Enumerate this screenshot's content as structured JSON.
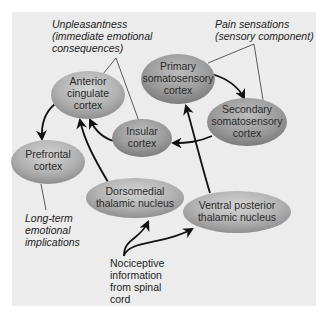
{
  "diagram": {
    "colors": {
      "background": "#ececec",
      "node_fill_light": "#c9c9c9",
      "node_fill_dark": "#8f8f8f",
      "arrow": "#111111",
      "leader_line": "#333333"
    },
    "nodes": {
      "anterior_cingulate": {
        "lines": [
          "Anterior",
          "cingulate",
          "cortex"
        ]
      },
      "primary_somatosensory": {
        "lines": [
          "Primary",
          "somatosensory",
          "cortex"
        ]
      },
      "secondary_somatosensory": {
        "lines": [
          "Secondary",
          "somatosensory",
          "cortex"
        ]
      },
      "insular": {
        "lines": [
          "Insular",
          "cortex"
        ]
      },
      "prefrontal": {
        "lines": [
          "Prefrontal",
          "cortex"
        ]
      },
      "dorsomedial": {
        "lines": [
          "Dorsomedial",
          "thalamic nucleus"
        ]
      },
      "ventral_posterior": {
        "lines": [
          "Ventral posterior",
          "thalamic nucleus"
        ]
      }
    },
    "annotations": {
      "unpleasantness": {
        "lines": [
          "Unpleasantness",
          "(immediate emotional",
          "consequences)"
        ]
      },
      "pain_sensations": {
        "lines": [
          "Pain sensations",
          "(sensory component)"
        ]
      },
      "long_term": {
        "lines": [
          "Long-term",
          "emotional",
          "implications"
        ]
      },
      "nociceptive": {
        "lines": [
          "Nociceptive",
          "information",
          "from spinal",
          "cord"
        ]
      }
    },
    "edges": [
      {
        "from": "Nociceptive information from spinal cord",
        "to": "Dorsomedial thalamic nucleus"
      },
      {
        "from": "Nociceptive information from spinal cord",
        "to": "Ventral posterior thalamic nucleus"
      },
      {
        "from": "Dorsomedial thalamic nucleus",
        "to": "Anterior cingulate cortex"
      },
      {
        "from": "Ventral posterior thalamic nucleus",
        "to": "Primary somatosensory cortex"
      },
      {
        "from": "Primary somatosensory cortex",
        "to": "Secondary somatosensory cortex"
      },
      {
        "from": "Secondary somatosensory cortex",
        "to": "Insular cortex"
      },
      {
        "from": "Insular cortex",
        "to": "Anterior cingulate cortex"
      },
      {
        "from": "Anterior cingulate cortex",
        "to": "Prefrontal cortex"
      }
    ]
  }
}
